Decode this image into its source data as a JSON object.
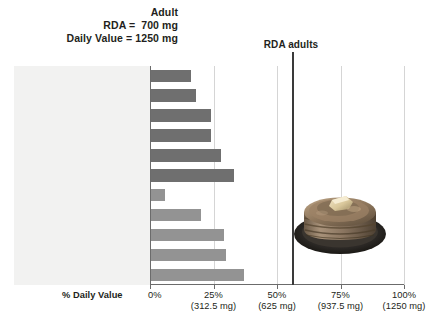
{
  "header": {
    "line1": "Adult",
    "line2": "RDA =  700 mg",
    "line3": "Daily Value = 1250 mg"
  },
  "rda_marker": {
    "label": "RDA adults",
    "value_percent": 56
  },
  "axis": {
    "title": "% Daily Value",
    "ticks": [
      {
        "percent": "0%",
        "mg": ""
      },
      {
        "percent": "25%",
        "mg": "(312.5 mg)"
      },
      {
        "percent": "50%",
        "mg": "(625 mg)"
      },
      {
        "percent": "75%",
        "mg": "(937.5 mg)"
      },
      {
        "percent": "100%",
        "mg": "(1250 mg)"
      }
    ]
  },
  "image": {
    "name": "pancakes-photo",
    "alt": "Stack of pancakes with butter on a dark plate"
  },
  "colors": {
    "bar_dark": "#6f6f6f",
    "bar_light": "#939393",
    "axis": "#6b6b6b",
    "gridline": "#d5d5d5",
    "rda_line": "#3a3a3a",
    "label_band": "#f2f2f1",
    "text": "#231f20"
  },
  "chart_data": {
    "type": "bar",
    "orientation": "horizontal",
    "xlabel": "% Daily Value",
    "ylabel": "",
    "xlim": [
      0,
      100
    ],
    "grid": true,
    "xticks": [
      0,
      25,
      50,
      75,
      100
    ],
    "xticklabels": [
      "0%",
      "25%",
      "50%",
      "75%",
      "100%"
    ],
    "xtick_sublabels": [
      "",
      "(312.5 mg)",
      "(625 mg)",
      "(937.5 mg)",
      "(1250 mg)"
    ],
    "annotations": [
      {
        "text": "RDA adults",
        "x": 56,
        "type": "vertical-line"
      }
    ],
    "categories": [
      "Tuna salad, ½ cup",
      "Chicken breast, 3 oz",
      "Trail mix, ½ cup",
      "Baked beans, 1 cup",
      "Pork chop, 3 oz",
      "Fish, 3 oz",
      "Blue cheese, 2 oz",
      "Milk, 1 cup",
      "Cottage cheese, 1 cup",
      "Yogurt, plain, 1 cup",
      "Pancakes, 2"
    ],
    "values": [
      16,
      18,
      24,
      24,
      28,
      33,
      6,
      20,
      29,
      30,
      37
    ],
    "bars": [
      {
        "label_pre": "Tuna salad, ",
        "frac_n": "1",
        "frac_d": "2",
        "label_post": " cup",
        "value": 16,
        "shade": "dark"
      },
      {
        "label_pre": "Chicken breast, 3 oz",
        "frac_n": "",
        "frac_d": "",
        "label_post": "",
        "value": 18,
        "shade": "dark"
      },
      {
        "label_pre": "Trail mix, ",
        "frac_n": "1",
        "frac_d": "2",
        "label_post": " cup",
        "value": 24,
        "shade": "dark"
      },
      {
        "label_pre": "Baked beans, 1 cup",
        "frac_n": "",
        "frac_d": "",
        "label_post": "",
        "value": 24,
        "shade": "dark"
      },
      {
        "label_pre": "Pork chop, 3 oz",
        "frac_n": "",
        "frac_d": "",
        "label_post": "",
        "value": 28,
        "shade": "dark"
      },
      {
        "label_pre": "Fish, 3 oz",
        "frac_n": "",
        "frac_d": "",
        "label_post": "",
        "value": 33,
        "shade": "dark"
      },
      {
        "label_pre": "Blue cheese, 2 oz",
        "frac_n": "",
        "frac_d": "",
        "label_post": "",
        "value": 6,
        "shade": "light"
      },
      {
        "label_pre": "Milk, 1 cup",
        "frac_n": "",
        "frac_d": "",
        "label_post": "",
        "value": 20,
        "shade": "light"
      },
      {
        "label_pre": "Cottage cheese, 1 cup",
        "frac_n": "",
        "frac_d": "",
        "label_post": "",
        "value": 29,
        "shade": "light"
      },
      {
        "label_pre": "Yogurt, plain, 1 cup",
        "frac_n": "",
        "frac_d": "",
        "label_post": "",
        "value": 30,
        "shade": "light"
      },
      {
        "label_pre": "Pancakes, 2",
        "frac_n": "",
        "frac_d": "",
        "label_post": "",
        "value": 37,
        "shade": "light"
      }
    ]
  }
}
